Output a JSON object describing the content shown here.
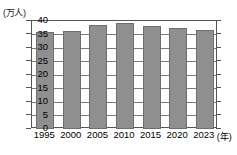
{
  "chart_data": {
    "type": "bar",
    "title": "",
    "subtitle": "",
    "xlabel": "(年)",
    "ylabel": "(万人)",
    "unit_label": "(万人)",
    "x_unit_label": "(年)",
    "categories": [
      "1995",
      "2000",
      "2005",
      "2010",
      "2015",
      "2020",
      "2023"
    ],
    "values": [
      36.0,
      36.3,
      38.7,
      39.3,
      38.0,
      37.3,
      36.8
    ],
    "series": [
      {
        "name": "人数",
        "values": [
          36.0,
          36.3,
          38.7,
          39.3,
          38.0,
          37.3,
          36.8
        ]
      }
    ],
    "ylim": [
      0,
      40
    ],
    "ytick_values": [
      0,
      5,
      10,
      15,
      20,
      25,
      30,
      35,
      40
    ],
    "ytick_labels": [
      "0",
      "5",
      "10",
      "15",
      "20",
      "25",
      "30",
      "35",
      "40"
    ],
    "grid": true,
    "grid_axis": "y",
    "legend": false,
    "legend_position": "none",
    "bar_color": "#8f8f8f",
    "bar_border_color": "#6e6e6e",
    "grid_color": "#7a7a7a",
    "frame_color": "#555555",
    "background_color": "#ffffff",
    "text_color": "#000000"
  }
}
